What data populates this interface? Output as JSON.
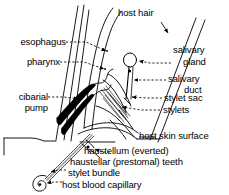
{
  "figure": {
    "type": "anatomical-diagram",
    "background_color": "#ffffff",
    "line_color": "#000000",
    "leader_style": "dashed with arrowhead",
    "width": 229,
    "height": 195
  },
  "labels": [
    {
      "id": "host-hair",
      "text": "host hair"
    },
    {
      "id": "esophagus",
      "text": "esophagus"
    },
    {
      "id": "pharynx",
      "text": "pharynx"
    },
    {
      "id": "cibarial-pump-line1",
      "text": "cibarial"
    },
    {
      "id": "cibarial-pump-line2",
      "text": "pump"
    },
    {
      "id": "salivary-gland-line1",
      "text": "salivary"
    },
    {
      "id": "salivary-gland-line2",
      "text": "gland"
    },
    {
      "id": "salivary-duct-line1",
      "text": "salivary"
    },
    {
      "id": "salivary-duct-line2",
      "text": "duct"
    },
    {
      "id": "stylet-sac",
      "text": "stylet sac"
    },
    {
      "id": "stylets",
      "text": "stylets"
    },
    {
      "id": "host-skin-surface",
      "text": "host skin surface"
    },
    {
      "id": "haustellum-everted",
      "text": "haustellum (everted)"
    },
    {
      "id": "haustellar-prestomal-teeth",
      "text": "haustellar (prestomal) teeth"
    },
    {
      "id": "stylet-bundle",
      "text": "stylet bundle"
    },
    {
      "id": "host-blood-capillary",
      "text": "host blood capillary"
    }
  ],
  "structures": [
    {
      "id": "host-hair-shaft",
      "name": "host hair shaft"
    },
    {
      "id": "proboscis-body",
      "name": "proboscis / head outline"
    },
    {
      "id": "esophagus-tube",
      "name": "esophagus tube"
    },
    {
      "id": "pharynx-chamber",
      "name": "pharynx chamber"
    },
    {
      "id": "cibarial-pump-mass",
      "name": "cibarial pump (solid black)"
    },
    {
      "id": "salivary-gland-node",
      "name": "salivary gland (oval node)"
    },
    {
      "id": "salivary-duct-line",
      "name": "salivary duct"
    },
    {
      "id": "stylet-sac-shape",
      "name": "stylet sac"
    },
    {
      "id": "stylet-fascicle",
      "name": "stylet bundle / fascicle"
    },
    {
      "id": "skin-surface-line",
      "name": "host skin surface line"
    },
    {
      "id": "haustellum-tip",
      "name": "haustellum (everted) tip"
    },
    {
      "id": "blood-capillary-coil",
      "name": "host blood capillary (spiral)"
    }
  ]
}
